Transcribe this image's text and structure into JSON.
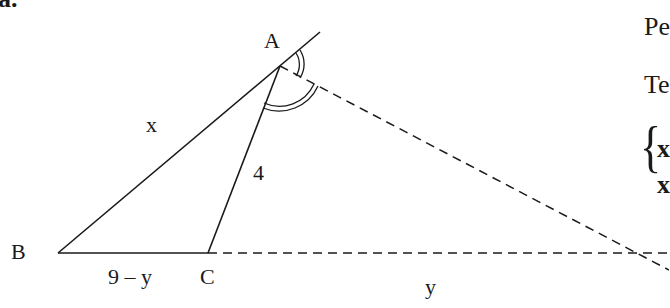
{
  "problem_label": "a.",
  "points": {
    "A": {
      "label": "A",
      "x": 280,
      "y": 66
    },
    "B": {
      "label": "B",
      "x": 58,
      "y": 253
    },
    "C": {
      "label": "C",
      "x": 208,
      "y": 253
    }
  },
  "segment_labels": {
    "AB": "x",
    "AC": "4",
    "BC": "9 – y",
    "C_to_right": "y"
  },
  "right_text": {
    "line1": "Pe",
    "line2": "Te",
    "system_row1": "x",
    "system_row2": "x",
    "brace": "{"
  },
  "colors": {
    "ink": "#1a1a1a",
    "background": "#ffffff"
  }
}
